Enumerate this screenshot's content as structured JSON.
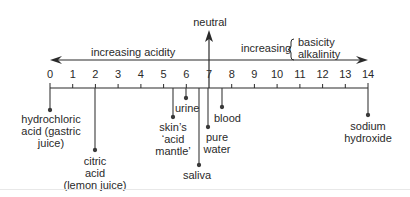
{
  "diagram": {
    "type": "pH scale",
    "neutral_label": "neutral",
    "acidity_label": "increasing acidity",
    "basicity_prefix": "increasing",
    "basicity_terms": [
      "basicity",
      "alkalinity"
    ],
    "scale": [
      "0",
      "1",
      "2",
      "3",
      "4",
      "5",
      "6",
      "7",
      "8",
      "9",
      "10",
      "11",
      "12",
      "13",
      "14"
    ],
    "substances": [
      {
        "name": "hydrochloric acid (gastric juice)",
        "lines": [
          "hydrochloric",
          "acid (gastric",
          "juice)"
        ],
        "ph": 0
      },
      {
        "name": "citric acid (lemon juice)",
        "lines": [
          "citric",
          "acid",
          "(lemon juice)"
        ],
        "ph": 2
      },
      {
        "name": "skin's 'acid mantle'",
        "lines": [
          "skin’s",
          "‘acid",
          "mantle’"
        ],
        "ph": 5.5
      },
      {
        "name": "urine",
        "lines": [
          "urine"
        ],
        "ph": 6
      },
      {
        "name": "saliva",
        "lines": [
          "saliva"
        ],
        "ph": 6.6
      },
      {
        "name": "pure water",
        "lines": [
          "pure",
          "water"
        ],
        "ph": 7
      },
      {
        "name": "blood",
        "lines": [
          "blood"
        ],
        "ph": 7.5
      },
      {
        "name": "sodium hydroxide",
        "lines": [
          "sodium",
          "hydroxide"
        ],
        "ph": 14
      }
    ]
  },
  "colors": {
    "ink": "#2a2a2a",
    "line": "#3a3a3a",
    "background": "#ffffff"
  }
}
